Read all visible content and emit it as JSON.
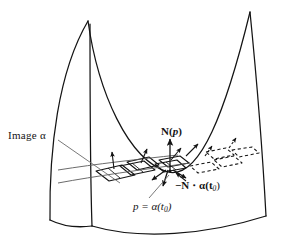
{
  "figure": {
    "background_color": "#ffffff",
    "ink_color": "#141414",
    "leader_color": "#4a4a4a",
    "width": 282,
    "height": 243
  },
  "labels": {
    "image_alpha": "Image α",
    "normal_at_p_bold": "N",
    "normal_at_p_arg": "(",
    "normal_at_p_var": "p",
    "normal_at_p_close": ")",
    "minus_normal_dot_alpha": "−N ⋅ α(t",
    "minus_normal_sub": "0",
    "minus_normal_close": ")",
    "p_equals_alpha": "p = α(t",
    "p_equals_alpha_sub": "0",
    "p_equals_alpha_close": ")"
  },
  "annotations": {
    "leader_image_alpha": "leader line from 'Image α' text to the leftmost tangent parallelogram",
    "leader_p": "leader line from 'p = α(t0)' text up to the point p on the curve",
    "leader_minus_n": "short arrow from '−N ⋅ α(t0)' text up-left to the downward normal at p"
  },
  "geometry": {
    "surface_name": "saddle-surface-outline",
    "curve_name": "alpha-curve",
    "tangent_planes_solid_count": 4,
    "tangent_planes_dashed_count": 4,
    "normal_arrows_solid_count": 4,
    "normal_arrows_dashed_count": 2
  }
}
